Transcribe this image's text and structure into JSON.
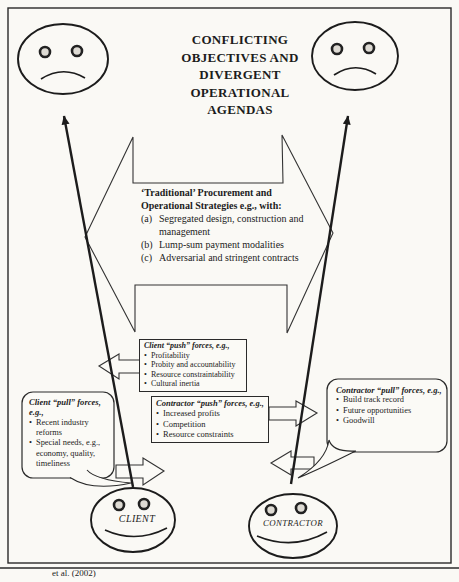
{
  "title": {
    "lines": [
      "CONFLICTING",
      "OBJECTIVES AND",
      "DIVERGENT",
      "OPERATIONAL",
      "AGENDAS"
    ]
  },
  "central": {
    "heading_lines": [
      "‘Traditional’ Procurement and",
      "Operational Strategies e.g., with:"
    ],
    "items": [
      {
        "marker": "(a)",
        "text": "Segregated design, construction and management"
      },
      {
        "marker": "(b)",
        "text": "Lump-sum payment modalities"
      },
      {
        "marker": "(c)",
        "text": "Adversarial and stringent contracts"
      }
    ]
  },
  "boxes": {
    "client_push": {
      "title": "Client “push” forces, e.g.,",
      "items": [
        "Profitability",
        "Probity and accountability",
        "Resource constraintability",
        "Cultural inertia"
      ]
    },
    "contractor_push": {
      "title": "Contractor “push” forces, e.g.,",
      "items": [
        "Increased profits",
        "Competition",
        "Resource constraints"
      ]
    },
    "client_pull": {
      "title": "Client “pull” forces, e.g.,",
      "items": [
        "Recent industry reforms",
        "Special needs, e.g., economy, quality, timeliness"
      ]
    },
    "contractor_pull": {
      "title": "Contractor “pull” forces, e.g.,",
      "items": [
        "Build track record",
        "Future opportunities",
        "Goodwill"
      ]
    }
  },
  "actors": {
    "client_label": "CLIENT",
    "contractor_label": "CONTRACTOR"
  },
  "caption_fragment": "et al. (2002)",
  "colors": {
    "ink": "#1c1c1c",
    "paper": "#faf9f5"
  }
}
